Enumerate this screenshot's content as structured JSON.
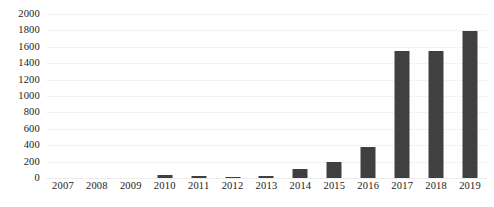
{
  "chart_data": {
    "type": "bar",
    "title": "",
    "subtitle": "",
    "xlabel": "",
    "ylabel": "",
    "categories": [
      "2007",
      "2008",
      "2009",
      "2010",
      "2011",
      "2012",
      "2013",
      "2014",
      "2015",
      "2016",
      "2017",
      "2018",
      "2019"
    ],
    "values": [
      0,
      0,
      0,
      40,
      20,
      15,
      30,
      105,
      200,
      375,
      1550,
      1555,
      1790
    ],
    "series": [
      {
        "name": "",
        "values": [
          0,
          0,
          0,
          40,
          20,
          15,
          30,
          105,
          200,
          375,
          1550,
          1555,
          1790
        ]
      }
    ],
    "ylim": [
      0,
      2000
    ],
    "ytick_step": 200,
    "yticks": [
      "2000",
      "1800",
      "1600",
      "1400",
      "1200",
      "1000",
      "800",
      "600",
      "400",
      "200",
      "0"
    ],
    "ytick_values": [
      2000,
      1800,
      1600,
      1400,
      1200,
      1000,
      800,
      600,
      400,
      200,
      0
    ],
    "xticks": [
      "2007",
      "2008",
      "2009",
      "2010",
      "2011",
      "2012",
      "2013",
      "2014",
      "2015",
      "2016",
      "2017",
      "2018",
      "2019"
    ],
    "grid": true,
    "grid_axis": "y",
    "legend": false,
    "legend_position": "none",
    "annotations": [],
    "colors": {
      "bar": "#404040",
      "grid": "#f2f2f2",
      "background": "#ffffff",
      "text": "#1a1a1a"
    }
  }
}
